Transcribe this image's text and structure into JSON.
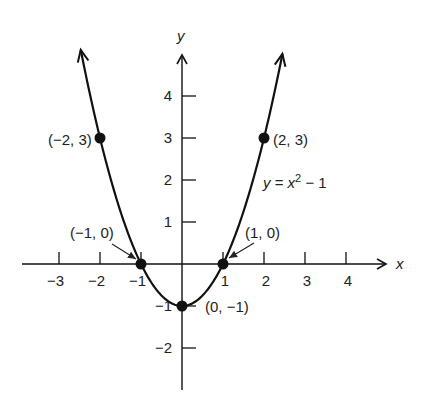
{
  "chart_data": {
    "type": "line",
    "title": "",
    "equation": "y = x² − 1",
    "equation_parts": {
      "lhs": "y = x",
      "exp": "2",
      "rhs": " − 1"
    },
    "xlabel": "x",
    "ylabel": "y",
    "xlim": [
      -3.9,
      4.9
    ],
    "ylim": [
      -3.0,
      5.2
    ],
    "grid": false,
    "legend": "none",
    "x_ticks": [
      {
        "value": -3,
        "label": "−3"
      },
      {
        "value": -2,
        "label": "−2"
      },
      {
        "value": -1,
        "label": "−1"
      },
      {
        "value": 1,
        "label": "1"
      },
      {
        "value": 2,
        "label": "2"
      },
      {
        "value": 3,
        "label": "3"
      },
      {
        "value": 4,
        "label": "4"
      }
    ],
    "y_ticks": [
      {
        "value": 4,
        "label": "4"
      },
      {
        "value": 3,
        "label": "3"
      },
      {
        "value": 2,
        "label": "2"
      },
      {
        "value": 1,
        "label": "1"
      },
      {
        "value": -1,
        "label": "−1"
      },
      {
        "value": -2,
        "label": "−2"
      }
    ],
    "series": [
      {
        "name": "y = x² − 1",
        "function": "x^2 - 1",
        "x_range": [
          -2.47,
          2.45
        ],
        "arrows_at_ends": true
      }
    ],
    "points": [
      {
        "x": -2,
        "y": 3,
        "label": "(−2, 3)"
      },
      {
        "x": 2,
        "y": 3,
        "label": "(2, 3)"
      },
      {
        "x": -1,
        "y": 0,
        "label": "(−1, 0)"
      },
      {
        "x": 1,
        "y": 0,
        "label": "(1, 0)"
      },
      {
        "x": 0,
        "y": -1,
        "label": "(0, −1)"
      }
    ]
  }
}
